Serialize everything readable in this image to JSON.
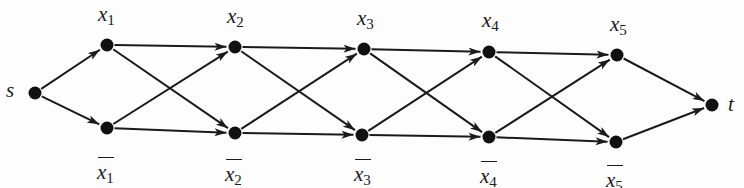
{
  "diagram": {
    "type": "directed-layered-graph",
    "nodes": [
      {
        "id": "s",
        "label": "s",
        "sub": "",
        "negated": false,
        "x": 35,
        "y": 93
      },
      {
        "id": "x1",
        "label": "x",
        "sub": "1",
        "negated": false,
        "x": 107,
        "y": 45
      },
      {
        "id": "nx1",
        "label": "x",
        "sub": "1",
        "negated": true,
        "x": 107,
        "y": 128
      },
      {
        "id": "x2",
        "label": "x",
        "sub": "2",
        "negated": false,
        "x": 235,
        "y": 47
      },
      {
        "id": "nx2",
        "label": "x",
        "sub": "2",
        "negated": true,
        "x": 235,
        "y": 133
      },
      {
        "id": "x3",
        "label": "x",
        "sub": "3",
        "negated": false,
        "x": 364,
        "y": 49
      },
      {
        "id": "nx3",
        "label": "x",
        "sub": "3",
        "negated": true,
        "x": 362,
        "y": 135
      },
      {
        "id": "x4",
        "label": "x",
        "sub": "4",
        "negated": false,
        "x": 489,
        "y": 52
      },
      {
        "id": "nx4",
        "label": "x",
        "sub": "4",
        "negated": true,
        "x": 489,
        "y": 137
      },
      {
        "id": "x5",
        "label": "x",
        "sub": "5",
        "negated": false,
        "x": 617,
        "y": 55
      },
      {
        "id": "nx5",
        "label": "x",
        "sub": "5",
        "negated": true,
        "x": 616,
        "y": 142
      },
      {
        "id": "t",
        "label": "t",
        "sub": "",
        "negated": false,
        "x": 712,
        "y": 105
      }
    ],
    "edges": [
      [
        "s",
        "x1"
      ],
      [
        "s",
        "nx1"
      ],
      [
        "x1",
        "x2"
      ],
      [
        "x1",
        "nx2"
      ],
      [
        "nx1",
        "x2"
      ],
      [
        "nx1",
        "nx2"
      ],
      [
        "x2",
        "x3"
      ],
      [
        "x2",
        "nx3"
      ],
      [
        "nx2",
        "x3"
      ],
      [
        "nx2",
        "nx3"
      ],
      [
        "x3",
        "x4"
      ],
      [
        "x3",
        "nx4"
      ],
      [
        "nx3",
        "x4"
      ],
      [
        "nx3",
        "nx4"
      ],
      [
        "x4",
        "x5"
      ],
      [
        "x4",
        "nx5"
      ],
      [
        "nx4",
        "x5"
      ],
      [
        "nx4",
        "nx5"
      ],
      [
        "x5",
        "t"
      ],
      [
        "nx5",
        "t"
      ]
    ],
    "colors": {
      "node": "#111111",
      "edge": "#1a1a1a",
      "background": "#fdfdfd"
    }
  },
  "labels": {
    "s": "s",
    "t": "t",
    "x": "x",
    "sub1": "1",
    "sub2": "2",
    "sub3": "3",
    "sub4": "4",
    "sub5": "5"
  }
}
